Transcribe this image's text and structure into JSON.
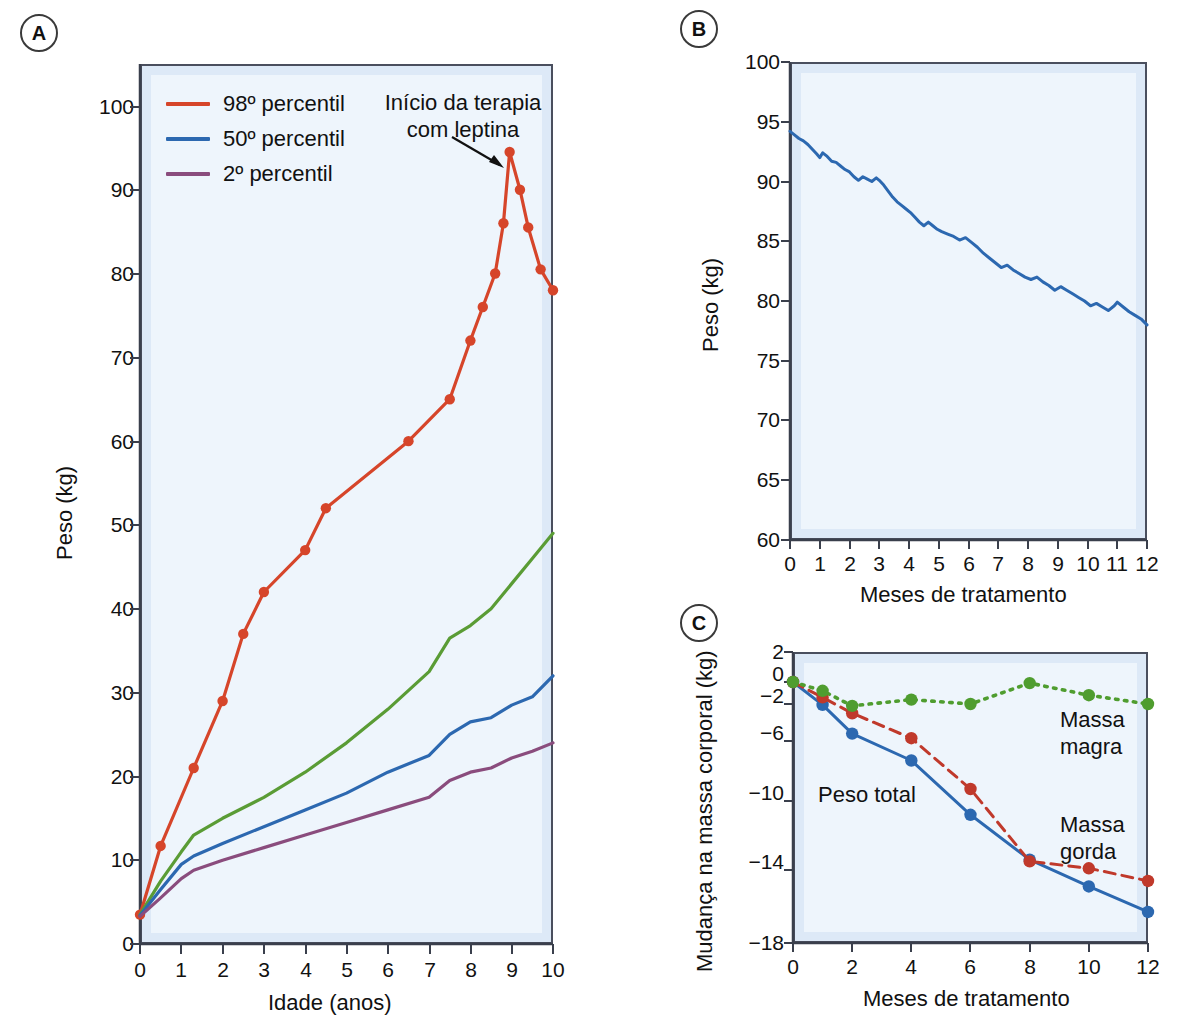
{
  "figure": {
    "panels": [
      "A",
      "B",
      "C"
    ]
  },
  "panelA": {
    "badge": "A",
    "legend": [
      {
        "label": "98º percentil",
        "color": "#d6452a"
      },
      {
        "label": "50º percentil",
        "color": "#2c68b0"
      },
      {
        "label": "2º percentil",
        "color": "#8a4c7d"
      }
    ],
    "annotation": "Início da terapia\ncom leptina",
    "xlabel": "Idade (anos)",
    "ylabel": "Peso (kg)",
    "xticks": [
      "0",
      "1",
      "2",
      "3",
      "4",
      "5",
      "6",
      "7",
      "8",
      "9",
      "10"
    ],
    "yticks": [
      "0",
      "10",
      "20",
      "30",
      "40",
      "50",
      "60",
      "70",
      "80",
      "90",
      "100"
    ]
  },
  "panelB": {
    "badge": "B",
    "xlabel": "Meses de tratamento",
    "ylabel": "Peso (kg)",
    "xticks": [
      "0",
      "1",
      "2",
      "3",
      "4",
      "5",
      "6",
      "7",
      "8",
      "9",
      "10",
      "11",
      "12"
    ],
    "yticks": [
      "60",
      "65",
      "70",
      "75",
      "80",
      "85",
      "90",
      "95",
      "100"
    ]
  },
  "panelC": {
    "badge": "C",
    "xlabel": "Meses de tratamento",
    "ylabel": "Mudança na massa corporal (kg)",
    "xticks": [
      "0",
      "2",
      "4",
      "6",
      "8",
      "10",
      "12"
    ],
    "yticks": [
      "−18",
      "−14",
      "−10",
      "−6",
      "−2",
      "0",
      "2"
    ],
    "labels": {
      "total": "Peso total",
      "lean": "Massa\nmagra",
      "fat": "Massa\ngorda"
    }
  },
  "chart_data": [
    {
      "id": "panel-a",
      "type": "line",
      "title": "A",
      "xlabel": "Idade (anos)",
      "ylabel": "Peso (kg)",
      "xlim": [
        0,
        10
      ],
      "ylim": [
        0,
        105
      ],
      "xticks": [
        0,
        1,
        2,
        3,
        4,
        5,
        6,
        7,
        8,
        9,
        10
      ],
      "yticks": [
        0,
        10,
        20,
        30,
        40,
        50,
        60,
        70,
        80,
        90,
        100
      ],
      "grid": false,
      "legend_position": "top-left",
      "annotations": [
        {
          "text": "Início da terapia com leptina",
          "x": 8.9,
          "y": 94.5
        }
      ],
      "series": [
        {
          "name": "Paciente (98º percentil curva vermelha)",
          "color": "#d6452a",
          "style": "solid",
          "markers": true,
          "points": [
            [
              0.0,
              3.5
            ],
            [
              0.5,
              11.7
            ],
            [
              1.3,
              21.0
            ],
            [
              2.0,
              29.0
            ],
            [
              2.5,
              37.0
            ],
            [
              3.0,
              42.0
            ],
            [
              4.0,
              47.0
            ],
            [
              4.5,
              52.0
            ],
            [
              6.5,
              60.0
            ],
            [
              7.5,
              65.0
            ],
            [
              8.0,
              72.0
            ],
            [
              8.3,
              76.0
            ],
            [
              8.6,
              80.0
            ],
            [
              8.8,
              86.0
            ],
            [
              8.95,
              94.5
            ],
            [
              9.2,
              90.0
            ],
            [
              9.4,
              85.5
            ],
            [
              9.7,
              80.5
            ],
            [
              10.0,
              78.0
            ]
          ]
        },
        {
          "name": "Curva de crescimento verde",
          "color": "#5a9c35",
          "style": "solid",
          "markers": false,
          "points": [
            [
              0.0,
              3.5
            ],
            [
              0.5,
              7.5
            ],
            [
              1.0,
              11.0
            ],
            [
              1.3,
              13.0
            ],
            [
              2.0,
              15.0
            ],
            [
              3.0,
              17.5
            ],
            [
              4.0,
              20.5
            ],
            [
              5.0,
              24.0
            ],
            [
              6.0,
              28.0
            ],
            [
              7.0,
              32.5
            ],
            [
              7.5,
              36.5
            ],
            [
              8.0,
              38.0
            ],
            [
              8.5,
              40.0
            ],
            [
              9.0,
              43.0
            ],
            [
              9.5,
              46.0
            ],
            [
              10.0,
              49.0
            ]
          ]
        },
        {
          "name": "50º percentil",
          "color": "#2c68b0",
          "style": "solid",
          "markers": false,
          "points": [
            [
              0.0,
              3.4
            ],
            [
              0.5,
              6.5
            ],
            [
              1.0,
              9.5
            ],
            [
              1.3,
              10.5
            ],
            [
              2.0,
              12.0
            ],
            [
              3.0,
              14.0
            ],
            [
              4.0,
              16.0
            ],
            [
              5.0,
              18.0
            ],
            [
              6.0,
              20.5
            ],
            [
              7.0,
              22.5
            ],
            [
              7.5,
              25.0
            ],
            [
              8.0,
              26.5
            ],
            [
              8.5,
              27.0
            ],
            [
              9.0,
              28.5
            ],
            [
              9.5,
              29.5
            ],
            [
              10.0,
              32.0
            ]
          ]
        },
        {
          "name": "2º percentil",
          "color": "#8a4c7d",
          "style": "solid",
          "markers": false,
          "points": [
            [
              0.0,
              3.3
            ],
            [
              0.5,
              5.5
            ],
            [
              1.0,
              7.8
            ],
            [
              1.3,
              8.8
            ],
            [
              2.0,
              10.0
            ],
            [
              3.0,
              11.5
            ],
            [
              4.0,
              13.0
            ],
            [
              5.0,
              14.5
            ],
            [
              6.0,
              16.0
            ],
            [
              7.0,
              17.5
            ],
            [
              7.5,
              19.5
            ],
            [
              8.0,
              20.5
            ],
            [
              8.5,
              21.0
            ],
            [
              9.0,
              22.2
            ],
            [
              9.5,
              23.0
            ],
            [
              10.0,
              24.0
            ]
          ]
        }
      ]
    },
    {
      "id": "panel-b",
      "type": "line",
      "title": "B",
      "xlabel": "Meses de tratamento",
      "ylabel": "Peso (kg)",
      "xlim": [
        0,
        12
      ],
      "ylim": [
        60,
        100
      ],
      "xticks": [
        0,
        1,
        2,
        3,
        4,
        5,
        6,
        7,
        8,
        9,
        10,
        11,
        12
      ],
      "yticks": [
        60,
        65,
        70,
        75,
        80,
        85,
        90,
        95,
        100
      ],
      "grid": false,
      "series": [
        {
          "name": "Peso",
          "color": "#2c68b0",
          "style": "solid",
          "markers": false,
          "points": [
            [
              0.0,
              94.2
            ],
            [
              0.15,
              93.9
            ],
            [
              0.3,
              93.6
            ],
            [
              0.45,
              93.4
            ],
            [
              0.6,
              93.1
            ],
            [
              0.75,
              92.7
            ],
            [
              0.9,
              92.3
            ],
            [
              1.0,
              92.0
            ],
            [
              1.1,
              92.4
            ],
            [
              1.25,
              92.1
            ],
            [
              1.4,
              91.7
            ],
            [
              1.55,
              91.6
            ],
            [
              1.7,
              91.3
            ],
            [
              1.85,
              91.0
            ],
            [
              2.0,
              90.8
            ],
            [
              2.15,
              90.4
            ],
            [
              2.3,
              90.1
            ],
            [
              2.45,
              90.4
            ],
            [
              2.6,
              90.2
            ],
            [
              2.75,
              90.0
            ],
            [
              2.9,
              90.3
            ],
            [
              3.0,
              90.1
            ],
            [
              3.15,
              89.7
            ],
            [
              3.3,
              89.2
            ],
            [
              3.45,
              88.7
            ],
            [
              3.6,
              88.3
            ],
            [
              3.75,
              88.0
            ],
            [
              3.9,
              87.7
            ],
            [
              4.05,
              87.4
            ],
            [
              4.2,
              87.0
            ],
            [
              4.35,
              86.6
            ],
            [
              4.5,
              86.3
            ],
            [
              4.65,
              86.6
            ],
            [
              4.8,
              86.3
            ],
            [
              4.95,
              86.0
            ],
            [
              5.1,
              85.8
            ],
            [
              5.3,
              85.6
            ],
            [
              5.5,
              85.4
            ],
            [
              5.7,
              85.1
            ],
            [
              5.9,
              85.3
            ],
            [
              6.1,
              84.9
            ],
            [
              6.3,
              84.5
            ],
            [
              6.5,
              84.0
            ],
            [
              6.7,
              83.6
            ],
            [
              6.9,
              83.2
            ],
            [
              7.1,
              82.8
            ],
            [
              7.3,
              83.0
            ],
            [
              7.5,
              82.6
            ],
            [
              7.7,
              82.3
            ],
            [
              7.9,
              82.0
            ],
            [
              8.1,
              81.8
            ],
            [
              8.3,
              82.0
            ],
            [
              8.5,
              81.6
            ],
            [
              8.7,
              81.3
            ],
            [
              8.9,
              80.9
            ],
            [
              9.1,
              81.2
            ],
            [
              9.3,
              80.9
            ],
            [
              9.5,
              80.6
            ],
            [
              9.7,
              80.3
            ],
            [
              9.9,
              80.0
            ],
            [
              10.1,
              79.6
            ],
            [
              10.3,
              79.8
            ],
            [
              10.5,
              79.5
            ],
            [
              10.7,
              79.2
            ],
            [
              10.9,
              79.6
            ],
            [
              11.0,
              79.9
            ],
            [
              11.2,
              79.5
            ],
            [
              11.4,
              79.1
            ],
            [
              11.6,
              78.8
            ],
            [
              11.8,
              78.5
            ],
            [
              12.0,
              78.0
            ]
          ]
        }
      ]
    },
    {
      "id": "panel-c",
      "type": "line",
      "title": "C",
      "xlabel": "Meses de tratamento",
      "ylabel": "Mudança na massa corporal (kg)",
      "xlim": [
        0,
        12
      ],
      "ylim": [
        -18,
        2
      ],
      "xticks": [
        0,
        2,
        4,
        6,
        8,
        10,
        12
      ],
      "yticks": [
        -18,
        -14,
        -10,
        -6,
        -2,
        0,
        2
      ],
      "grid": false,
      "series": [
        {
          "name": "Peso total",
          "color": "#2c68b0",
          "style": "solid",
          "markers": true,
          "points": [
            [
              0,
              0.0
            ],
            [
              1,
              -2.1
            ],
            [
              2,
              -5.2
            ],
            [
              4,
              -7.3
            ],
            [
              6,
              -10.8
            ],
            [
              8,
              -13.4
            ],
            [
              10,
              -14.9
            ],
            [
              12,
              -16.3
            ]
          ]
        },
        {
          "name": "Massa gorda",
          "color": "#c0392b",
          "style": "dashed",
          "markers": true,
          "points": [
            [
              0,
              0.0
            ],
            [
              1,
              -1.4
            ],
            [
              2,
              -3.0
            ],
            [
              4,
              -5.7
            ],
            [
              6,
              -9.2
            ],
            [
              8,
              -13.5
            ],
            [
              10,
              -13.9
            ],
            [
              12,
              -14.6
            ]
          ]
        },
        {
          "name": "Massa magra",
          "color": "#4f9d2f",
          "style": "dotted",
          "markers": true,
          "points": [
            [
              0,
              0.0
            ],
            [
              1,
              -0.8
            ],
            [
              2,
              -2.2
            ],
            [
              4,
              -1.6
            ],
            [
              6,
              -2.0
            ],
            [
              8,
              -0.1
            ],
            [
              10,
              -1.2
            ],
            [
              12,
              -2.0
            ]
          ]
        }
      ]
    }
  ]
}
